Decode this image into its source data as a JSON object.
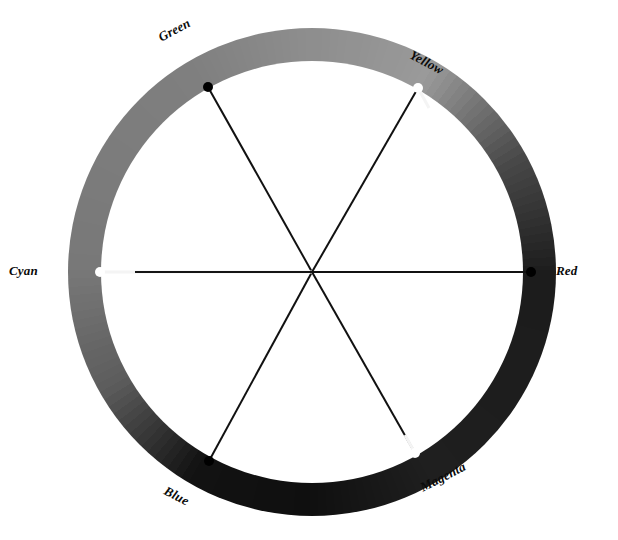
{
  "figure": {
    "name": "color-wheel",
    "background": "#ffffff",
    "center": {
      "x": 312,
      "y": 272
    },
    "outer_radius": 244,
    "inner_radius": 211,
    "hub_radius": 0
  },
  "chart_data": {
    "type": "pie",
    "title": "",
    "subtitle": "",
    "xlabel": "",
    "ylabel": "",
    "legend_position": "around-ring",
    "grid": false,
    "categories": [
      "Red",
      "Yellow",
      "Green",
      "Cyan",
      "Blue",
      "Magenta"
    ],
    "values": [
      60,
      60,
      60,
      60,
      60,
      60
    ],
    "angles_deg": [
      0,
      60,
      120,
      180,
      240,
      300
    ],
    "annotations": [
      "Six primary and secondary hues arranged at 60 degree intervals around a continuous hue ring.",
      "Complementary pairs are joined by straight spokes through the center: Red-Cyan, Green-Magenta, Blue-Yellow."
    ],
    "series": [
      {
        "name": "hue ring luminance",
        "values": [
          26,
          85,
          88,
          122,
          18,
          34
        ]
      }
    ]
  },
  "ring": {
    "stops": [
      {
        "angle_deg": 0,
        "hue": "Red",
        "gray": "#1c1c1c"
      },
      {
        "angle_deg": 30,
        "hue": "Orange",
        "gray": "#4a4a4a"
      },
      {
        "angle_deg": 60,
        "hue": "Yellow",
        "gray": "#9a9a9a"
      },
      {
        "angle_deg": 90,
        "hue": "Chartreuse",
        "gray": "#8e8e8e"
      },
      {
        "angle_deg": 120,
        "hue": "Green",
        "gray": "#7f7f7f"
      },
      {
        "angle_deg": 150,
        "hue": "Spring",
        "gray": "#7c7c7c"
      },
      {
        "angle_deg": 180,
        "hue": "Cyan",
        "gray": "#787878"
      },
      {
        "angle_deg": 210,
        "hue": "Azure",
        "gray": "#5c5c5c"
      },
      {
        "angle_deg": 240,
        "hue": "Blue",
        "gray": "#121212"
      },
      {
        "angle_deg": 270,
        "hue": "Violet",
        "gray": "#0f0f0f"
      },
      {
        "angle_deg": 300,
        "hue": "Magenta",
        "gray": "#1f1f1f"
      },
      {
        "angle_deg": 330,
        "hue": "Rose",
        "gray": "#1d1d1d"
      },
      {
        "angle_deg": 360,
        "hue": "Red",
        "gray": "#1c1c1c"
      }
    ]
  },
  "spokes": [
    {
      "id": "red-cyan",
      "label_a": "Red",
      "label_b": "Cyan",
      "angle_deg": 0,
      "line_color_a": "#111111",
      "line_color_b": "#f2f2f2",
      "marker_a": {
        "x": 531,
        "y": 272,
        "fill": "#000000"
      },
      "marker_b": {
        "x": 100,
        "y": 272,
        "fill": "#ffffff"
      }
    },
    {
      "id": "yellow-blue",
      "label_a": "Yellow",
      "label_b": "Blue",
      "angle_deg": 60,
      "line_color_a": "#f2f2f2",
      "line_color_b": "#111111",
      "marker_a": {
        "x": 418,
        "y": 88,
        "fill": "#ffffff"
      },
      "marker_b": {
        "x": 209,
        "y": 461,
        "fill": "#000000"
      }
    },
    {
      "id": "green-magenta",
      "label_a": "Green",
      "label_b": "Magenta",
      "angle_deg": 120,
      "line_color_a": "#111111",
      "line_color_b": "#f2f2f2",
      "marker_a": {
        "x": 208,
        "y": 87,
        "fill": "#000000"
      },
      "marker_b": {
        "x": 415,
        "y": 453,
        "fill": "#ffffff"
      }
    }
  ],
  "labels": {
    "green": "Green",
    "yellow": "Yellow",
    "red": "Red",
    "magenta": "Magenta",
    "blue": "Blue",
    "cyan": "Cyan"
  }
}
